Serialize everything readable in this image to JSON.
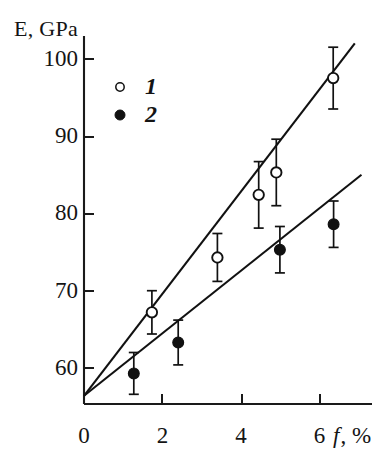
{
  "figure": {
    "axis_color": "#1a1a1a",
    "marker_color": "#111111",
    "background": "#ffffff"
  },
  "axes": {
    "y_title": "E, GPa",
    "x_title_symbol": "f",
    "x_title_rest": ", %",
    "y_ticks": [
      "100",
      "90",
      "80",
      "70",
      "60"
    ],
    "x_ticks": [
      "0",
      "2",
      "4",
      "6"
    ]
  },
  "legend": {
    "items": [
      {
        "label": "1",
        "marker": "open-circle"
      },
      {
        "label": "2",
        "marker": "filled-circle"
      }
    ]
  },
  "chart_data": {
    "type": "scatter",
    "title": "",
    "xlabel": "f, %",
    "ylabel": "E, GPa",
    "xlim": [
      0,
      7.4
    ],
    "ylim": [
      56,
      103
    ],
    "xticks": [
      0,
      2,
      4,
      6
    ],
    "yticks": [
      60,
      70,
      80,
      90,
      100
    ],
    "grid": false,
    "legend_position": "upper-left",
    "error_bars": "vertical, symmetric caps",
    "series": [
      {
        "name": "1",
        "marker": "open-circle",
        "points": [
          {
            "x": 1.73,
            "y": 67.2,
            "yerr": 2.8
          },
          {
            "x": 3.4,
            "y": 74.3,
            "yerr": 3.1
          },
          {
            "x": 4.45,
            "y": 82.4,
            "yerr": 4.3
          },
          {
            "x": 4.9,
            "y": 85.3,
            "yerr": 4.3
          },
          {
            "x": 6.35,
            "y": 97.5,
            "yerr": 4.0
          }
        ],
        "fit_line": {
          "x0": 0.0,
          "y0": 56.4,
          "x1": 6.9,
          "y1": 102.0
        }
      },
      {
        "name": "2",
        "marker": "filled-circle",
        "points": [
          {
            "x": 1.27,
            "y": 59.3,
            "yerr": 2.7
          },
          {
            "x": 2.4,
            "y": 63.3,
            "yerr": 2.9
          },
          {
            "x": 4.99,
            "y": 75.3,
            "yerr": 3.0
          },
          {
            "x": 6.36,
            "y": 78.6,
            "yerr": 3.0
          }
        ],
        "fit_line": {
          "x0": 0.0,
          "y0": 56.4,
          "x1": 7.07,
          "y1": 85.0
        }
      }
    ]
  }
}
